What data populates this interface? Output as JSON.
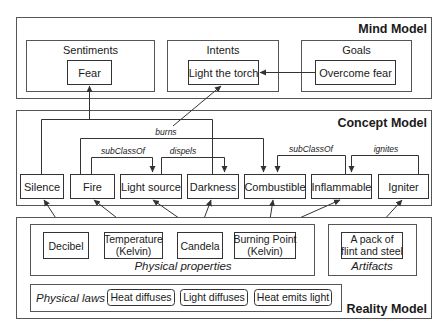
{
  "mind_model": {
    "title": "Mind Model",
    "groups": {
      "sentiments": {
        "label": "Sentiments",
        "item": "Fear"
      },
      "intents": {
        "label": "Intents",
        "item": "Light the torch"
      },
      "goals": {
        "label": "Goals",
        "item": "Overcome fear"
      }
    }
  },
  "concept_model": {
    "title": "Concept Model",
    "nodes": {
      "silence": "Silence",
      "fire": "Fire",
      "light_source": "Light source",
      "darkness": "Darkness",
      "combustible": "Combustible",
      "inflammable": "Inflammable",
      "igniter": "Igniter"
    },
    "relations": {
      "burns": "burns",
      "subclassof_1": "subClassOf",
      "dispels": "dispels",
      "subclassof_2": "subClassOf",
      "ignites": "ignites"
    }
  },
  "reality_model": {
    "title": "Reality Model",
    "physical_properties": {
      "caption": "Physical properties",
      "decibel": "Decibel",
      "temperature_line1": "Temperature",
      "temperature_line2": "(Kelvin)",
      "candela": "Candela",
      "burning_point_line1": "Burning Point",
      "burning_point_line2": "(Kelvin)"
    },
    "artifacts": {
      "caption": "Artifacts",
      "flint_line1": "A pack of",
      "flint_line2": "flint and steel"
    },
    "physical_laws": {
      "caption": "Physical laws",
      "items": [
        "Heat diffuses",
        "Light diffuses",
        "Heat emits light"
      ]
    }
  },
  "colors": {
    "stroke": "#333333",
    "frame": "#555555",
    "text": "#1a1a1a",
    "background": "#ffffff"
  }
}
